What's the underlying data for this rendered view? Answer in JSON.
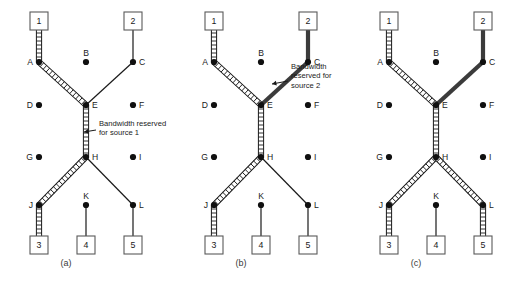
{
  "figure": {
    "panels": [
      {
        "id": "a",
        "caption": "(a)",
        "offset_x": 0,
        "annotation": {
          "lines": [
            "Bandwidth reserved",
            "for source 1"
          ],
          "line1": "Bandwidth reserved",
          "line2": "for source 1",
          "x": 98,
          "y": 120,
          "arrow_from_x": 96,
          "arrow_from_y": 130,
          "arrow_to_x": 84,
          "arrow_to_y": 132
        },
        "reserved_source1_path": [
          "1",
          "A",
          "E",
          "H",
          "J",
          "3"
        ],
        "reserved_source2_path": []
      },
      {
        "id": "b",
        "caption": "(b)",
        "offset_x": 175,
        "annotation": {
          "lines": [
            "Bandwidth",
            "reserved for",
            "source 2"
          ],
          "line1": "Bandwidth",
          "line2": "reserved for",
          "line3": "source 2",
          "x": 290,
          "y": 63,
          "arrow_from_x": 288,
          "arrow_from_y": 81,
          "arrow_to_x": 272,
          "arrow_to_y": 84
        },
        "reserved_source1_path": [
          "1",
          "A",
          "E",
          "H",
          "J",
          "3"
        ],
        "reserved_source2_path": [
          "2",
          "C",
          "E",
          "H",
          "J",
          "3"
        ]
      },
      {
        "id": "c",
        "caption": "(c)",
        "offset_x": 350,
        "annotation": null,
        "reserved_source1_path": [
          "1",
          "A",
          "E",
          "H",
          "J",
          "3",
          "H",
          "L",
          "5"
        ],
        "reserved_source2_path": [
          "2",
          "C",
          "E",
          "H",
          "J",
          "3"
        ]
      }
    ],
    "nodes": [
      {
        "id": "A",
        "label": "A",
        "x": 39,
        "y": 62,
        "label_side": "left"
      },
      {
        "id": "B",
        "label": "B",
        "x": 86,
        "y": 62,
        "label_side": "above"
      },
      {
        "id": "C",
        "label": "C",
        "x": 133,
        "y": 62,
        "label_side": "right"
      },
      {
        "id": "D",
        "label": "D",
        "x": 39,
        "y": 105,
        "label_side": "left"
      },
      {
        "id": "E",
        "label": "E",
        "x": 86,
        "y": 105,
        "label_side": "right"
      },
      {
        "id": "F",
        "label": "F",
        "x": 133,
        "y": 105,
        "label_side": "right"
      },
      {
        "id": "G",
        "label": "G",
        "x": 39,
        "y": 157,
        "label_side": "left"
      },
      {
        "id": "H",
        "label": "H",
        "x": 86,
        "y": 157,
        "label_side": "right"
      },
      {
        "id": "I",
        "label": "I",
        "x": 133,
        "y": 157,
        "label_side": "right"
      },
      {
        "id": "J",
        "label": "J",
        "x": 39,
        "y": 205,
        "label_side": "left"
      },
      {
        "id": "K",
        "label": "K",
        "x": 86,
        "y": 205,
        "label_side": "above"
      },
      {
        "id": "L",
        "label": "L",
        "x": 133,
        "y": 205,
        "label_side": "right"
      }
    ],
    "hosts": [
      {
        "id": "1",
        "label": "1",
        "x": 39,
        "y": 21,
        "attached_node": "A"
      },
      {
        "id": "2",
        "label": "2",
        "x": 133,
        "y": 21,
        "attached_node": "C"
      },
      {
        "id": "3",
        "label": "3",
        "x": 39,
        "y": 245,
        "attached_node": "J"
      },
      {
        "id": "4",
        "label": "4",
        "x": 86,
        "y": 245,
        "attached_node": "K"
      },
      {
        "id": "5",
        "label": "5",
        "x": 133,
        "y": 245,
        "attached_node": "L"
      }
    ],
    "links": [
      {
        "from": "1",
        "to": "A"
      },
      {
        "from": "2",
        "to": "C"
      },
      {
        "from": "A",
        "to": "E"
      },
      {
        "from": "C",
        "to": "E"
      },
      {
        "from": "E",
        "to": "H"
      },
      {
        "from": "H",
        "to": "J"
      },
      {
        "from": "H",
        "to": "L"
      },
      {
        "from": "J",
        "to": "3"
      },
      {
        "from": "K",
        "to": "4"
      },
      {
        "from": "L",
        "to": "5"
      }
    ],
    "colors": {
      "source1_fill": "#ffffff",
      "source1_stroke": "#1a1a1a",
      "source2": "#3b3b3b",
      "plain_link": "#1a1a1a",
      "node_dot": "#101010",
      "box_stroke": "#5a5a5a",
      "text": "#1a1a1a"
    }
  }
}
